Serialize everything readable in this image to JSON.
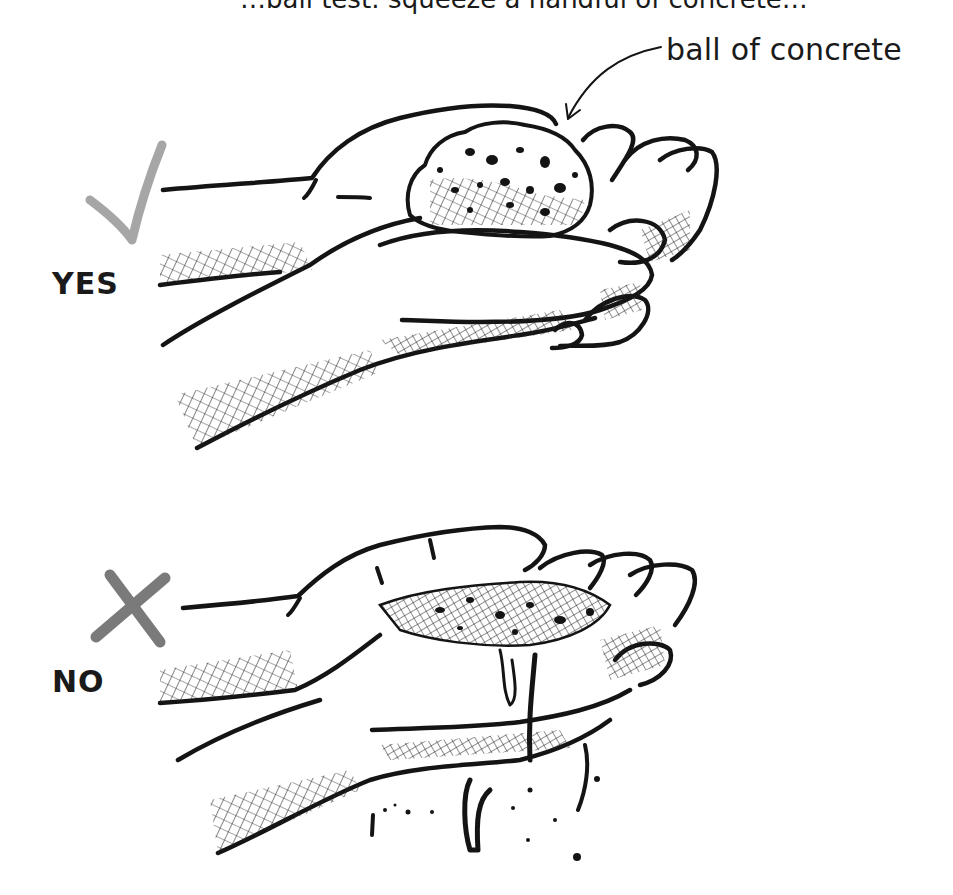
{
  "figure": {
    "title_partial": "…ball test: squeeze a handful of concrete…",
    "callout_label": "ball of concrete",
    "panels": [
      {
        "id": "yes",
        "label": "YES",
        "mark": "check",
        "mark_color": "#a6a6a6",
        "description": "concrete holds its shape as a ball in the hand"
      },
      {
        "id": "no",
        "label": "NO",
        "mark": "cross",
        "mark_color": "#7a7a7a",
        "description": "concrete slumps and drips through the fingers"
      }
    ]
  },
  "colors": {
    "ink": "#141414",
    "check": "#a6a6a6",
    "cross": "#7a7a7a",
    "background": "#ffffff"
  }
}
